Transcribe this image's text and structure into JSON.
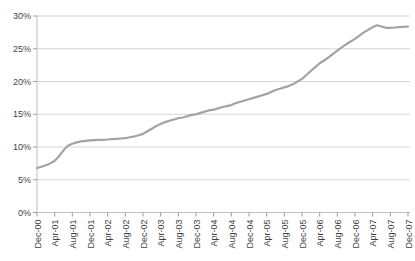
{
  "chart_data": {
    "type": "line",
    "title": "",
    "xlabel": "",
    "ylabel": "",
    "ylim": [
      0,
      30
    ],
    "grid": true,
    "legend_position": "none",
    "y_tick_labels": [
      "0%",
      "5%",
      "10%",
      "15%",
      "20%",
      "25%",
      "30%"
    ],
    "y_tick_values": [
      0,
      5,
      10,
      15,
      20,
      25,
      30
    ],
    "x_tick_labels": [
      "Dec-00",
      "Apr-01",
      "Aug-01",
      "Dec-01",
      "Apr-02",
      "Aug-02",
      "Dec-02",
      "Apr-03",
      "Aug-03",
      "Dec-03",
      "Apr-04",
      "Aug-04",
      "Dec-04",
      "Apr-05",
      "Aug-05",
      "Dec-05",
      "Apr-06",
      "Aug-06",
      "Dec-06",
      "Apr-07",
      "Aug-07",
      "Dec-07"
    ],
    "x_tick_every_n_points": 4,
    "x": [
      "Dec-00",
      "Jan-01",
      "Feb-01",
      "Mar-01",
      "Apr-01",
      "May-01",
      "Jun-01",
      "Jul-01",
      "Aug-01",
      "Sep-01",
      "Oct-01",
      "Nov-01",
      "Dec-01",
      "Jan-02",
      "Feb-02",
      "Mar-02",
      "Apr-02",
      "May-02",
      "Jun-02",
      "Jul-02",
      "Aug-02",
      "Sep-02",
      "Oct-02",
      "Nov-02",
      "Dec-02",
      "Jan-03",
      "Feb-03",
      "Mar-03",
      "Apr-03",
      "May-03",
      "Jun-03",
      "Jul-03",
      "Aug-03",
      "Sep-03",
      "Oct-03",
      "Nov-03",
      "Dec-03",
      "Jan-04",
      "Feb-04",
      "Mar-04",
      "Apr-04",
      "May-04",
      "Jun-04",
      "Jul-04",
      "Aug-04",
      "Sep-04",
      "Oct-04",
      "Nov-04",
      "Dec-04",
      "Jan-05",
      "Feb-05",
      "Mar-05",
      "Apr-05",
      "May-05",
      "Jun-05",
      "Jul-05",
      "Aug-05",
      "Sep-05",
      "Oct-05",
      "Nov-05",
      "Dec-05",
      "Jan-06",
      "Feb-06",
      "Mar-06",
      "Apr-06",
      "May-06",
      "Jun-06",
      "Jul-06",
      "Aug-06",
      "Sep-06",
      "Oct-06",
      "Nov-06",
      "Dec-06",
      "Jan-07",
      "Feb-07",
      "Mar-07",
      "Apr-07",
      "May-07",
      "Jun-07",
      "Jul-07",
      "Aug-07",
      "Sep-07",
      "Oct-07",
      "Nov-07",
      "Dec-07"
    ],
    "series": [
      {
        "name": "percentage-series",
        "values": [
          6.8,
          7.0,
          7.2,
          7.5,
          7.9,
          8.6,
          9.5,
          10.2,
          10.5,
          10.7,
          10.85,
          10.95,
          11.0,
          11.05,
          11.1,
          11.1,
          11.15,
          11.2,
          11.25,
          11.3,
          11.35,
          11.5,
          11.6,
          11.8,
          12.0,
          12.4,
          12.8,
          13.2,
          13.5,
          13.8,
          14.0,
          14.2,
          14.4,
          14.5,
          14.7,
          14.9,
          15.0,
          15.2,
          15.4,
          15.6,
          15.7,
          15.9,
          16.1,
          16.25,
          16.4,
          16.7,
          16.9,
          17.1,
          17.3,
          17.5,
          17.7,
          17.9,
          18.1,
          18.4,
          18.7,
          18.9,
          19.1,
          19.3,
          19.6,
          20.0,
          20.4,
          21.0,
          21.6,
          22.2,
          22.8,
          23.2,
          23.7,
          24.2,
          24.7,
          25.2,
          25.7,
          26.1,
          26.5,
          27.0,
          27.5,
          27.9,
          28.3,
          28.6,
          28.4,
          28.2,
          28.2,
          28.25,
          28.3,
          28.35,
          28.4
        ]
      }
    ],
    "colors": {
      "line": "#a3a3a3",
      "gridline": "#d6d6d6",
      "axis": "#c0c0c0",
      "tick": "#9a9a9a",
      "label": "#3f3f3f",
      "background": "#ffffff"
    }
  }
}
